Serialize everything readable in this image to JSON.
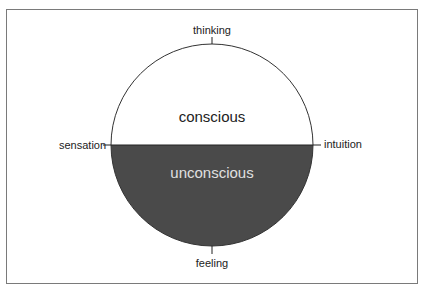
{
  "diagram": {
    "axes": {
      "top": "thinking",
      "bottom": "feeling",
      "left": "sensation",
      "right": "intuition"
    },
    "regions": {
      "upper": "conscious",
      "lower": "unconscious"
    },
    "colors": {
      "upper_fill": "#ffffff",
      "lower_fill": "#4a4a4a",
      "outline": "#333333",
      "lower_text": "#e0e0e0"
    }
  }
}
